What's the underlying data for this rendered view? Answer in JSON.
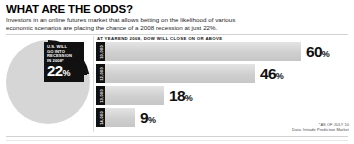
{
  "headline": "WHAT ARE THE ODDS?",
  "deck": "Investors in an online futures market that allows betting on the likelihood of various economic scenarios are placing the chance of a 2008 recession at just 22%.",
  "pie": {
    "callout_line1": "U.S. WILL",
    "callout_line2": "GO INTO",
    "callout_line3": "RECESSION",
    "callout_line4": "IN 2008*",
    "value_label": "22",
    "percent_symbol": "%"
  },
  "bar_chart_title": "AT YEAREND 2008, DOW WILL CLOSE ON OR ABOVE",
  "source": {
    "line1": "*AS OF JULY 10",
    "line2": "Data: Intrade Prediction Market"
  },
  "colors": {
    "ink": "#111111",
    "bar_fill": "#cfcfcf",
    "pie_remainder": "#d6d6d6",
    "rule": "#d2d2d2"
  },
  "chart_data": [
    {
      "type": "pie",
      "title": "U.S. WILL GO INTO RECESSION IN 2008*",
      "categories": [
        "Chance of recession",
        "No recession"
      ],
      "values": [
        22,
        78
      ],
      "labels": [
        "22%",
        ""
      ],
      "unit": "percent",
      "legend": "none"
    },
    {
      "type": "bar",
      "orientation": "horizontal",
      "title": "AT YEAREND 2008, DOW WILL CLOSE ON OR ABOVE",
      "categories": [
        "10,000",
        "12,000",
        "13,000",
        "14,000"
      ],
      "values": [
        60,
        46,
        18,
        9
      ],
      "labels": [
        "60%",
        "46%",
        "18%",
        "9%"
      ],
      "xlabel": "",
      "ylabel": "",
      "xlim": [
        0,
        100
      ],
      "unit": "percent",
      "grid": false,
      "legend": "none"
    }
  ],
  "bars": [
    {
      "tag": "10,000",
      "value": 60,
      "label": "60",
      "percent_symbol": "%",
      "width_px": 196
    },
    {
      "tag": "12,000",
      "value": 46,
      "label": "46",
      "percent_symbol": "%",
      "width_px": 150
    },
    {
      "tag": "13,000",
      "value": 18,
      "label": "18",
      "percent_symbol": "%",
      "width_px": 59
    },
    {
      "tag": "14,000",
      "value": 9,
      "label": "9",
      "percent_symbol": "%",
      "width_px": 30
    }
  ]
}
